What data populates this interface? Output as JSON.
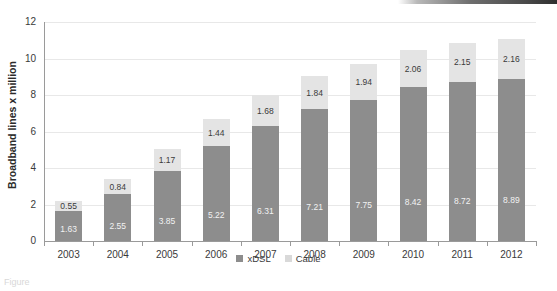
{
  "chart_data": {
    "type": "bar",
    "stacked": true,
    "title": "",
    "xlabel": "",
    "ylabel": "Broadband lines x million",
    "categories": [
      "2003",
      "2004",
      "2005",
      "2006",
      "2007",
      "2008",
      "2009",
      "2010",
      "2011",
      "2012"
    ],
    "ylim": [
      0,
      12
    ],
    "yticks": [
      "0",
      "2",
      "4",
      "6",
      "8",
      "10",
      "12"
    ],
    "grid": true,
    "legend_position": "bottom",
    "series": [
      {
        "name": "xDSL",
        "color": "#8d8d8d",
        "values": [
          1.63,
          2.55,
          3.85,
          5.22,
          6.31,
          7.21,
          7.75,
          8.42,
          8.72,
          8.89
        ],
        "labels": [
          "1.63",
          "2.55",
          "3.85",
          "5.22",
          "6.31",
          "7.21",
          "7.75",
          "8.42",
          "8.72",
          "8.89"
        ]
      },
      {
        "name": "Cable",
        "color": "#e4e4e4",
        "values": [
          0.55,
          0.84,
          1.17,
          1.44,
          1.68,
          1.84,
          1.94,
          2.06,
          2.15,
          2.16
        ],
        "labels": [
          "0.55",
          "0.84",
          "1.17",
          "1.44",
          "1.68",
          "1.84",
          "1.94",
          "2.06",
          "2.15",
          "2.16"
        ]
      }
    ]
  },
  "caption": {
    "text": "Figure"
  }
}
